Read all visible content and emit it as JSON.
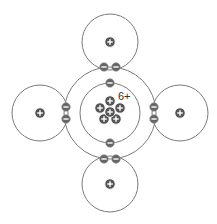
{
  "diagram": {
    "type": "covalent-bonding",
    "molecule": "methane",
    "central_atom": {
      "nucleus_label": "6+",
      "protons": 6,
      "inner_shell_electrons": 2,
      "outer_shell_electrons": 8
    },
    "hydrogen_atoms": [
      {
        "position": "top",
        "nucleus_symbol": "+",
        "shared_electrons": 2
      },
      {
        "position": "left",
        "nucleus_symbol": "+",
        "shared_electrons": 2
      },
      {
        "position": "right",
        "nucleus_symbol": "+",
        "shared_electrons": 2
      },
      {
        "position": "bottom",
        "nucleus_symbol": "+",
        "shared_electrons": 2
      }
    ],
    "colors": {
      "shell_stroke": "#7a7a7a",
      "particle_fill": "#555555",
      "particle_symbol": "#ffffff",
      "background": "#ffffff"
    }
  }
}
